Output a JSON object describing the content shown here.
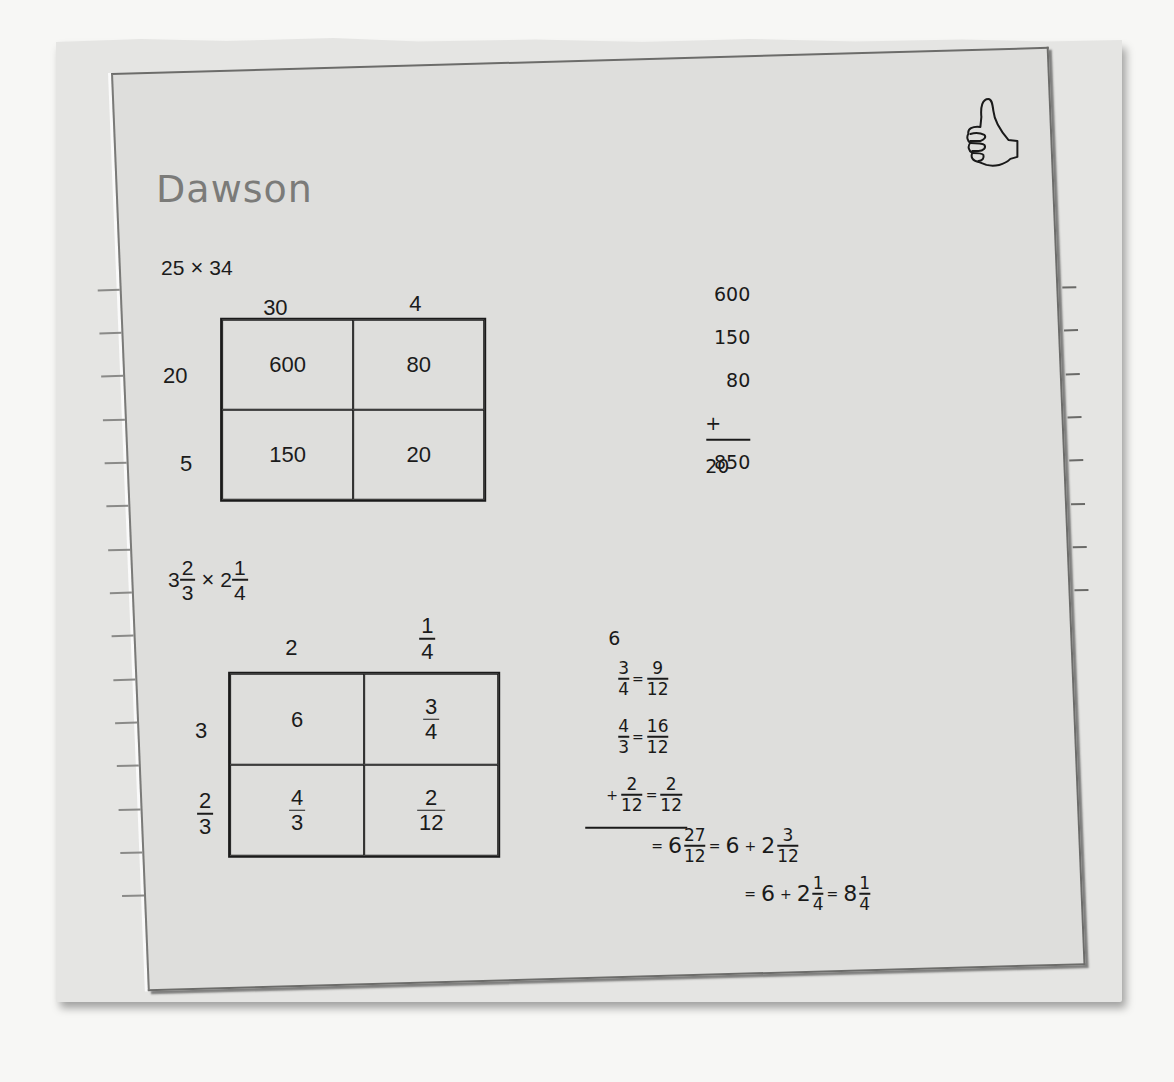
{
  "student": {
    "name": "Dawson"
  },
  "icons": {
    "feedback": "thumbs-up-icon"
  },
  "colors": {
    "card": "#dededc",
    "background": "#f7f7f5",
    "ink": "#1b1b1b",
    "name_ink": "#7b7b79"
  },
  "problem1": {
    "expression": {
      "a": "25",
      "op": "×",
      "b": "34"
    },
    "area_model": {
      "col_headers": [
        "30",
        "4"
      ],
      "row_headers": [
        "20",
        "5"
      ],
      "cells": [
        [
          "600",
          "80"
        ],
        [
          "150",
          "20"
        ]
      ]
    },
    "addition": {
      "addends": [
        "600",
        "150",
        "80",
        "+ 20"
      ],
      "total": "850"
    }
  },
  "problem2": {
    "expression": {
      "a_whole": "3",
      "a_num": "2",
      "a_den": "3",
      "op": "×",
      "b_whole": "2",
      "b_num": "1",
      "b_den": "4"
    },
    "area_model": {
      "col_headers": [
        {
          "text": "2"
        },
        {
          "num": "1",
          "den": "4"
        }
      ],
      "row_headers": [
        {
          "text": "3"
        },
        {
          "num": "2",
          "den": "3"
        }
      ],
      "cells": [
        [
          {
            "text": "6"
          },
          {
            "num": "3",
            "den": "4"
          }
        ],
        [
          {
            "num": "4",
            "den": "3"
          },
          {
            "num": "2",
            "den": "12"
          }
        ]
      ]
    },
    "work": {
      "whole": "6",
      "conversions": [
        {
          "sign": "",
          "from_num": "3",
          "from_den": "4",
          "eq": "=",
          "to_num": "9",
          "to_den": "12"
        },
        {
          "sign": "",
          "from_num": "4",
          "from_den": "3",
          "eq": "=",
          "to_num": "16",
          "to_den": "12"
        },
        {
          "sign": "+",
          "from_num": "2",
          "from_den": "12",
          "eq": "=",
          "to_num": "2",
          "to_den": "12"
        }
      ],
      "result_line1": {
        "eq1": "=",
        "whole1": "6",
        "num1": "27",
        "den1": "12",
        "eq2": "=",
        "w2": "6",
        "plus": "+",
        "w3": "2",
        "num2": "3",
        "den2": "12"
      },
      "result_line2": {
        "eq1": "=",
        "w1": "6",
        "plus": "+",
        "w2": "2",
        "num1": "1",
        "den1": "4",
        "eq2": "=",
        "w3": "8",
        "num2": "1",
        "den2": "4"
      }
    }
  }
}
